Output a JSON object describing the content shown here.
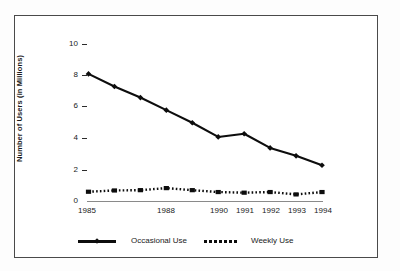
{
  "chart_data": {
    "type": "line",
    "title": "",
    "xlabel": "",
    "ylabel": "Number of Users (in Millions)",
    "x": [
      1985,
      1986,
      1987,
      1988,
      1989,
      1990,
      1991,
      1992,
      1993,
      1994
    ],
    "categories": [
      "1985",
      "1986",
      "1987",
      "1988",
      "1989",
      "1990",
      "1991",
      "1992",
      "1993",
      "1994"
    ],
    "xtick_labels": [
      "1985",
      "1988",
      "1990",
      "1991",
      "1992",
      "1993",
      "1994"
    ],
    "xtick_values": [
      1985,
      1988,
      1990,
      1991,
      1992,
      1993,
      1994
    ],
    "ytick_labels": [
      "0",
      "2",
      "4",
      "6",
      "8",
      "10"
    ],
    "ytick_values": [
      0,
      2,
      4,
      6,
      8,
      10
    ],
    "ylim": [
      0,
      10
    ],
    "xlim": [
      1985,
      1994
    ],
    "grid": false,
    "legend_position": "bottom",
    "series": [
      {
        "name": "Occasional Use",
        "style": "solid",
        "marker": "diamond",
        "color": "#0d0d0d",
        "values": [
          8.1,
          7.3,
          6.6,
          5.8,
          5.0,
          4.1,
          4.3,
          3.4,
          2.9,
          2.3
        ]
      },
      {
        "name": "Weekly Use",
        "style": "dotted",
        "marker": "square",
        "color": "#0d0d0d",
        "values": [
          0.62,
          0.7,
          0.72,
          0.85,
          0.72,
          0.6,
          0.56,
          0.6,
          0.45,
          0.6
        ]
      }
    ]
  },
  "legend": {
    "items": [
      {
        "label": "Occasional Use",
        "style": "solid"
      },
      {
        "label": "Weekly Use",
        "style": "dotted"
      }
    ]
  },
  "axes": {
    "y_title": "Number of Users (in Millions)"
  }
}
